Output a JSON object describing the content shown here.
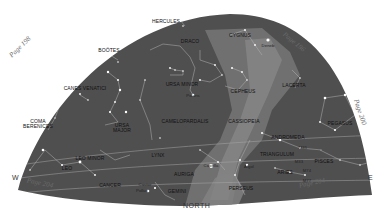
{
  "chart_title": "Northern sky star map",
  "directions": {
    "west": "W",
    "east": "E",
    "north": "NORTH"
  },
  "page_refs": [
    {
      "label": "Page 198",
      "x": 20,
      "y": 47,
      "rot": -44
    },
    {
      "label": "Page 196",
      "x": 294,
      "y": 42,
      "rot": 40
    },
    {
      "label": "Page 200",
      "x": 360,
      "y": 112,
      "rot": 72
    },
    {
      "label": "Page 204",
      "x": 40,
      "y": 183,
      "rot": 12
    },
    {
      "label": "Page 204",
      "x": 312,
      "y": 183,
      "rot": -12
    }
  ],
  "constellations": [
    {
      "name": "HERCULES",
      "x": 166,
      "y": 21
    },
    {
      "name": "DRACO",
      "x": 190,
      "y": 41
    },
    {
      "name": "CYGNUS",
      "x": 240,
      "y": 35
    },
    {
      "name": "BOÖTES",
      "x": 109,
      "y": 50
    },
    {
      "name": "URSA MINOR",
      "x": 182,
      "y": 84
    },
    {
      "name": "CEPHEUS",
      "x": 243,
      "y": 91
    },
    {
      "name": "LACERTA",
      "x": 294,
      "y": 85
    },
    {
      "name": "CANES VENATICI",
      "x": 85,
      "y": 88
    },
    {
      "name": "COMA BERENICES",
      "x": 38,
      "y": 124
    },
    {
      "name": "URSA MAJOR",
      "x": 122,
      "y": 128
    },
    {
      "name": "CAMELOPARDALIS",
      "x": 185,
      "y": 121
    },
    {
      "name": "CASSIOPEIA",
      "x": 244,
      "y": 121
    },
    {
      "name": "PEGASUS",
      "x": 340,
      "y": 123
    },
    {
      "name": "ANDROMEDA",
      "x": 288,
      "y": 137
    },
    {
      "name": "LEO MINOR",
      "x": 90,
      "y": 158
    },
    {
      "name": "LYNX",
      "x": 158,
      "y": 155
    },
    {
      "name": "TRIANGULUM",
      "x": 277,
      "y": 154
    },
    {
      "name": "PISCES",
      "x": 324,
      "y": 161
    },
    {
      "name": "LEO",
      "x": 67,
      "y": 168
    },
    {
      "name": "AURIGA",
      "x": 184,
      "y": 174
    },
    {
      "name": "ARIES",
      "x": 285,
      "y": 172
    },
    {
      "name": "CANCER",
      "x": 110,
      "y": 185
    },
    {
      "name": "GEMINI",
      "x": 177,
      "y": 191
    },
    {
      "name": "PERSEUS",
      "x": 241,
      "y": 188
    }
  ],
  "star_labels": [
    {
      "name": "Deneb",
      "x": 268,
      "y": 45
    },
    {
      "name": "Polaris",
      "x": 193,
      "y": 95
    },
    {
      "name": "Capella",
      "x": 211,
      "y": 165
    },
    {
      "name": "Algol",
      "x": 249,
      "y": 166
    },
    {
      "name": "Castor",
      "x": 145,
      "y": 184
    },
    {
      "name": "Pollux",
      "x": 142,
      "y": 190
    },
    {
      "name": "M31",
      "x": 303,
      "y": 147
    },
    {
      "name": "M33",
      "x": 299,
      "y": 161
    },
    {
      "name": "M74",
      "x": 307,
      "y": 170
    },
    {
      "name": "M77",
      "x": 307,
      "y": 180
    }
  ],
  "colors": {
    "sky": "#4f4f4f",
    "milky_way": "#7a7a7a",
    "milky_way_core": "#8d8d8d",
    "lines": "#a8a8a8",
    "stars": "#ffffff",
    "background": "#ffffff"
  }
}
